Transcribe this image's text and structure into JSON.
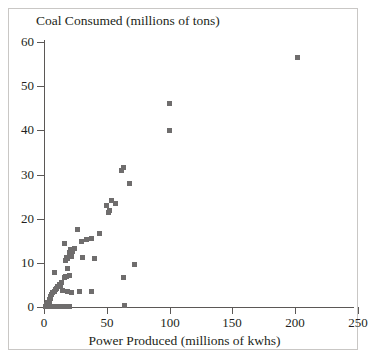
{
  "figure": {
    "background_color": "#ffffff",
    "frame_color": "#c9c7c5",
    "axis_color": "#5b5856",
    "marker_color": "#6f6d6d"
  },
  "chart_data": {
    "type": "scatter",
    "title": "",
    "ylabel": "Coal Consumed (millions of tons)",
    "xlabel": "Power Produced (millions of kwhs)",
    "xlim": [
      0,
      250
    ],
    "ylim": [
      0,
      60
    ],
    "xticks": [
      0,
      50,
      100,
      150,
      200,
      250
    ],
    "yticks": [
      0,
      10,
      20,
      30,
      40,
      50,
      60
    ],
    "xticklabels": [
      "0",
      "50",
      "100",
      "150",
      "200",
      "250"
    ],
    "yticklabels": [
      "0",
      "10",
      "20",
      "30",
      "40",
      "50",
      "60"
    ],
    "grid": false,
    "legend": null,
    "marker": "square",
    "series": [
      {
        "name": "plants",
        "points": [
          [
            202,
            56.5
          ],
          [
            100,
            46.0
          ],
          [
            100,
            40.0
          ],
          [
            63,
            31.5
          ],
          [
            62,
            30.8
          ],
          [
            68,
            28.0
          ],
          [
            54,
            24.2
          ],
          [
            50,
            23.0
          ],
          [
            57,
            23.4
          ],
          [
            52,
            21.8
          ],
          [
            51,
            21.3
          ],
          [
            27,
            17.6
          ],
          [
            44,
            16.6
          ],
          [
            16,
            14.4
          ],
          [
            34,
            15.2
          ],
          [
            30,
            14.8
          ],
          [
            38,
            15.6
          ],
          [
            23,
            12.6
          ],
          [
            22,
            12.2
          ],
          [
            21,
            11.9
          ],
          [
            20,
            12.4
          ],
          [
            22,
            11.4
          ],
          [
            19,
            11.0
          ],
          [
            18,
            11.2
          ],
          [
            21,
            13.0
          ],
          [
            24,
            13.3
          ],
          [
            17,
            10.6
          ],
          [
            40,
            11.0
          ],
          [
            31,
            11.2
          ],
          [
            72,
            9.6
          ],
          [
            19,
            8.7
          ],
          [
            8,
            7.7
          ],
          [
            17,
            7.0
          ],
          [
            18,
            6.8
          ],
          [
            20,
            7.1
          ],
          [
            16,
            6.6
          ],
          [
            63,
            6.7
          ],
          [
            14,
            5.6
          ],
          [
            12,
            5.2
          ],
          [
            13,
            4.9
          ],
          [
            11,
            4.6
          ],
          [
            10,
            4.3
          ],
          [
            9,
            4.0
          ],
          [
            15,
            3.8
          ],
          [
            19,
            3.4
          ],
          [
            22,
            3.2
          ],
          [
            28,
            3.5
          ],
          [
            38,
            3.5
          ],
          [
            8,
            3.6
          ],
          [
            7,
            3.2
          ],
          [
            6,
            2.8
          ],
          [
            5,
            2.4
          ],
          [
            5,
            2.0
          ],
          [
            4,
            1.7
          ],
          [
            4,
            1.3
          ],
          [
            3,
            1.0
          ],
          [
            3,
            0.7
          ],
          [
            2,
            0.5
          ],
          [
            2,
            0.3
          ],
          [
            1,
            0.2
          ],
          [
            1,
            0.15
          ],
          [
            3,
            0.2
          ],
          [
            5,
            0.2
          ],
          [
            7,
            0.2
          ],
          [
            9,
            0.2
          ],
          [
            11,
            0.2
          ],
          [
            13,
            0.2
          ],
          [
            16,
            0.2
          ],
          [
            20,
            0.2
          ],
          [
            64,
            0.3
          ]
        ]
      }
    ]
  }
}
